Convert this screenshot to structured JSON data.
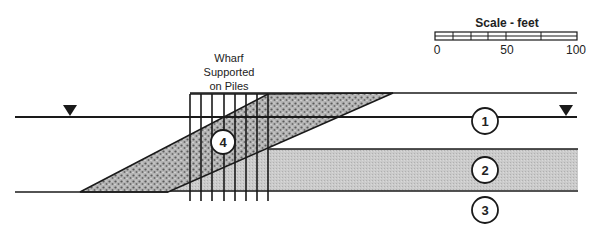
{
  "scale": {
    "title": "Scale - feet",
    "ticks": [
      {
        "label": "0",
        "x": 437
      },
      {
        "label": "50",
        "x": 507
      },
      {
        "label": "100",
        "x": 576
      }
    ]
  },
  "wharf_label": {
    "lines": [
      "Wharf",
      "Supported",
      "on Piles"
    ]
  },
  "zones": [
    {
      "id": "1",
      "label": "1",
      "cx": 485,
      "cy": 121
    },
    {
      "id": "2",
      "label": "2",
      "cx": 485,
      "cy": 170
    },
    {
      "id": "3",
      "label": "3",
      "cx": 485,
      "cy": 210
    },
    {
      "id": "4",
      "label": "4",
      "cx": 223,
      "cy": 142
    }
  ],
  "colors": {
    "line": "#1a1a1a",
    "layer2_fill": "#c8c8c8",
    "rock_fill": "#9a9a9a",
    "background": "#ffffff"
  },
  "water_level_markers": [
    {
      "x": 70,
      "y": 117
    },
    {
      "x": 566,
      "y": 117
    }
  ]
}
